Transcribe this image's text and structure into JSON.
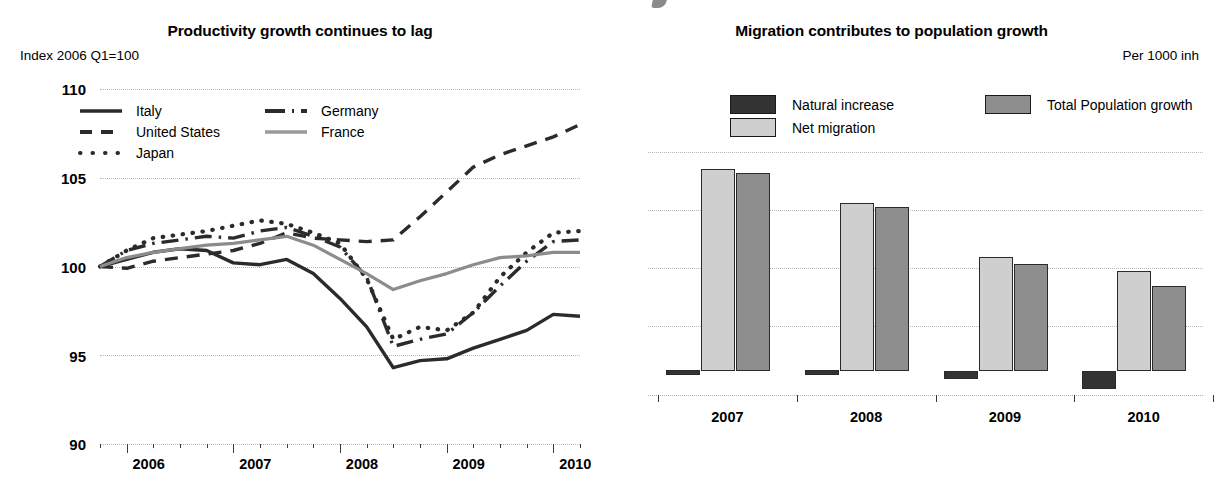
{
  "left_panel": {
    "title": "Productivity growth continues to lag",
    "axis_note": "Index 2006 Q1=100",
    "legend": [
      {
        "label": "Italy",
        "style": "solid",
        "color": "#2b2b2b"
      },
      {
        "label": "United States",
        "style": "dashed",
        "color": "#2b2b2b"
      },
      {
        "label": "Japan",
        "style": "dotted",
        "color": "#2b2b2b"
      },
      {
        "label": "Germany",
        "style": "dash-dot",
        "color": "#2b2b2b"
      },
      {
        "label": "France",
        "style": "solid-gray",
        "color": "#8c8c8c"
      }
    ],
    "yticks": [
      "110",
      "105",
      "100",
      "95",
      "90"
    ],
    "xticks": [
      "2006",
      "2007",
      "2008",
      "2009",
      "2010"
    ]
  },
  "right_panel": {
    "title": "Migration contributes to population growth",
    "axis_note": "Per 1000 inh",
    "legend": [
      {
        "label": "Natural increase",
        "color": "#333333"
      },
      {
        "label": "Net migration",
        "color": "#cfcfcf"
      },
      {
        "label": "Total Population growth",
        "color": "#8e8e8e"
      }
    ],
    "xticks": [
      "2007",
      "2008",
      "2009",
      "2010"
    ]
  },
  "chart_data": [
    {
      "type": "line",
      "title": "Productivity growth continues to lag",
      "ylabel": "Index 2006 Q1=100",
      "xlabel": "",
      "ylim": [
        90,
        110
      ],
      "yticks": [
        90,
        95,
        100,
        105,
        110
      ],
      "grid": true,
      "legend_position": "top-left inside plot",
      "x": [
        "2006Q1",
        "2006Q2",
        "2006Q3",
        "2006Q4",
        "2007Q1",
        "2007Q2",
        "2007Q3",
        "2007Q4",
        "2008Q1",
        "2008Q2",
        "2008Q3",
        "2008Q4",
        "2009Q1",
        "2009Q2",
        "2009Q3",
        "2009Q4",
        "2010Q1",
        "2010Q2",
        "2010Q3"
      ],
      "xtick_labels": [
        "2006",
        "2007",
        "2008",
        "2009",
        "2010"
      ],
      "series": [
        {
          "name": "Italy",
          "style": "solid",
          "color": "#2b2b2b",
          "values": [
            100.0,
            100.4,
            100.8,
            101.0,
            100.9,
            100.2,
            100.1,
            100.4,
            99.6,
            98.2,
            96.6,
            94.3,
            94.7,
            94.8,
            95.4,
            95.9,
            96.4,
            97.3,
            97.2
          ]
        },
        {
          "name": "United States",
          "style": "dashed",
          "color": "#2b2b2b",
          "values": [
            100.0,
            99.9,
            100.3,
            100.5,
            100.7,
            100.9,
            101.3,
            101.9,
            101.6,
            101.5,
            101.4,
            101.5,
            102.8,
            104.2,
            105.6,
            106.3,
            106.8,
            107.3,
            108.0
          ]
        },
        {
          "name": "Japan",
          "style": "dotted",
          "color": "#2b2b2b",
          "values": [
            100.0,
            100.9,
            101.6,
            101.8,
            102.0,
            102.3,
            102.6,
            102.4,
            101.9,
            101.3,
            99.3,
            95.9,
            96.6,
            96.4,
            97.4,
            99.4,
            100.8,
            101.9,
            102.0
          ]
        },
        {
          "name": "Germany",
          "style": "dash-dot",
          "color": "#2b2b2b",
          "values": [
            100.0,
            100.9,
            101.3,
            101.5,
            101.7,
            101.6,
            102.0,
            102.2,
            101.7,
            101.1,
            99.4,
            95.5,
            95.9,
            96.2,
            97.4,
            98.9,
            100.3,
            101.4,
            101.5
          ]
        },
        {
          "name": "France",
          "style": "solid-gray",
          "color": "#8c8c8c",
          "values": [
            100.0,
            100.5,
            100.8,
            101.0,
            101.2,
            101.3,
            101.5,
            101.7,
            101.2,
            100.4,
            99.6,
            98.7,
            99.2,
            99.6,
            100.1,
            100.5,
            100.6,
            100.8,
            100.8
          ]
        }
      ]
    },
    {
      "type": "bar",
      "title": "Migration contributes to population growth",
      "ylabel": "Per 1000 inh",
      "xlabel": "",
      "grid": true,
      "ylim": [
        -1,
        9
      ],
      "gridline_values": [
        8,
        6,
        4,
        2,
        0
      ],
      "categories": [
        "2007",
        "2008",
        "2009",
        "2010"
      ],
      "legend_position": "top inside plot",
      "series": [
        {
          "name": "Natural increase",
          "color": "#333333",
          "values": [
            0.05,
            0.05,
            -0.35,
            -0.75
          ]
        },
        {
          "name": "Net migration",
          "color": "#cfcfcf",
          "values": [
            8.3,
            6.9,
            4.7,
            4.1
          ]
        },
        {
          "name": "Total Population growth",
          "color": "#8e8e8e",
          "values": [
            8.15,
            6.75,
            4.4,
            3.5
          ]
        }
      ]
    }
  ]
}
